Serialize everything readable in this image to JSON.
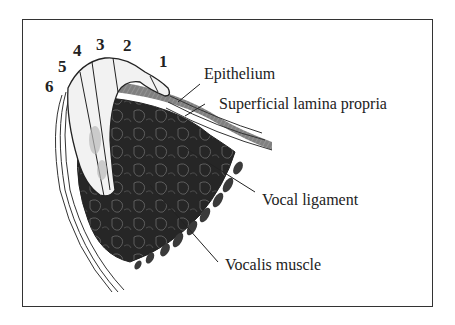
{
  "diagram": {
    "type": "anatomical cross-section (vocal fold)",
    "layer_numbers": [
      {
        "id": "1",
        "label": "1"
      },
      {
        "id": "2",
        "label": "2"
      },
      {
        "id": "3",
        "label": "3"
      },
      {
        "id": "4",
        "label": "4"
      },
      {
        "id": "5",
        "label": "5"
      },
      {
        "id": "6",
        "label": "6"
      }
    ],
    "labels": {
      "epithelium": "Epithelium",
      "superficial_lamina_propria": "Superficial lamina propria",
      "vocal_ligament": "Vocal ligament",
      "vocalis_muscle": "Vocalis muscle"
    },
    "colors": {
      "ink": "#222222",
      "muscle_fill": "#2a2a2a",
      "background": "#ffffff"
    }
  }
}
